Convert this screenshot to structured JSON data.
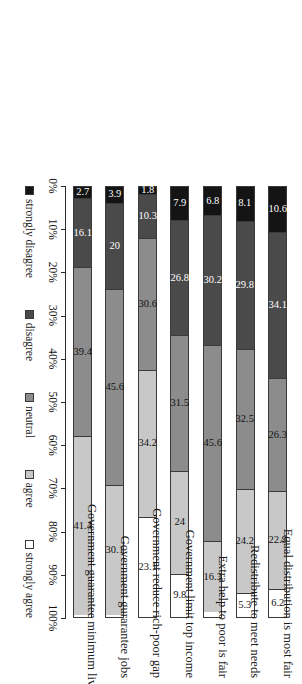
{
  "chart_data": {
    "type": "bar",
    "orientation": "horizontal-stacked",
    "title": "",
    "xlabel": "",
    "ylabel": "",
    "xlim": [
      0,
      100
    ],
    "xticks": [
      "0%",
      "10%",
      "20%",
      "30%",
      "40%",
      "50%",
      "60%",
      "70%",
      "80%",
      "90%",
      "100%"
    ],
    "grid": false,
    "legend_position": "bottom",
    "categories": [
      "Equal distribution is most fair",
      "Redistribute to meet needs",
      "Extra help to poor is fair",
      "Government limit top income",
      "Government reduce rich-poor gap",
      "Government gurarantee jobs",
      "Government guarantee minimum living standard"
    ],
    "series": [
      {
        "name": "strongly disagree",
        "color": "#141414",
        "values": [
          10.6,
          8.1,
          6.8,
          7.9,
          1.8,
          3.9,
          2.7
        ]
      },
      {
        "name": "disagree",
        "color": "#4a4a4a",
        "values": [
          34.1,
          29.8,
          30.2,
          26.8,
          10.3,
          20.0,
          16.1
        ]
      },
      {
        "name": "neutral",
        "color": "#8c8c8c",
        "values": [
          26.3,
          32.5,
          45.6,
          31.5,
          30.6,
          45.6,
          39.4
        ]
      },
      {
        "name": "agree",
        "color": "#c8c8c8",
        "values": [
          22.9,
          24.2,
          16.3,
          24.0,
          34.2,
          30.1,
          41.4
        ]
      },
      {
        "name": "strongly agree",
        "color": "#ffffff",
        "values": [
          6.2,
          5.3,
          0.0,
          9.8,
          23.1,
          0.0,
          0.0
        ]
      }
    ],
    "data_labels": [
      [
        "10.6",
        "34.1",
        "26.3",
        "22.9",
        "6.2"
      ],
      [
        "8.1",
        "29.8",
        "32.5",
        "24.2",
        "5.3"
      ],
      [
        "6.8",
        "30.2",
        "45.6",
        "16.3",
        ""
      ],
      [
        "7.9",
        "26.8",
        "31.5",
        "24",
        "9.8"
      ],
      [
        "1.8",
        "10.3",
        "30.6",
        "34.2",
        "23.1"
      ],
      [
        "3.9",
        "20",
        "45.6",
        "30.1",
        ""
      ],
      [
        "2.7",
        "16.1",
        "39.4",
        "41.4",
        ""
      ]
    ]
  },
  "legend": {
    "items": [
      {
        "label": "strongly disagree",
        "color": "#141414"
      },
      {
        "label": "disagree",
        "color": "#4a4a4a"
      },
      {
        "label": "neutral",
        "color": "#8c8c8c"
      },
      {
        "label": "agree",
        "color": "#c8c8c8"
      },
      {
        "label": "strongly agree",
        "color": "#ffffff"
      }
    ]
  }
}
